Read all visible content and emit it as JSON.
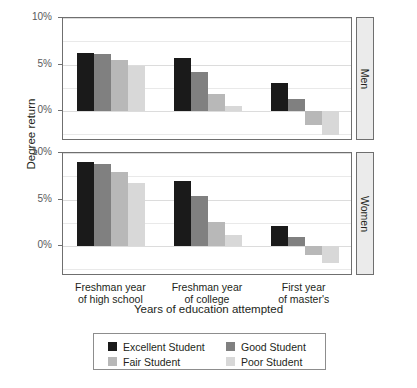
{
  "chart_data": {
    "type": "bar",
    "title": "",
    "xlabel": "Years of education attempted",
    "ylabel": "Degree return",
    "categories": [
      "Freshman year\nof high school",
      "Freshman year\nof college",
      "First year\nof master's"
    ],
    "category_lines": [
      [
        "Freshman year",
        "of high school"
      ],
      [
        "Freshman year",
        "of college"
      ],
      [
        "First year",
        "of master's"
      ]
    ],
    "ylim": [
      -3.2,
      10
    ],
    "ytick_values": [
      10,
      5,
      0
    ],
    "ytick_labels": [
      "10%",
      "5%",
      "0%"
    ],
    "gridlines": [
      10,
      7.5,
      5,
      2.5,
      0,
      -2.5
    ],
    "grid": true,
    "legend_position": "bottom",
    "facet_variable": "sex",
    "facets": [
      {
        "name": "Men",
        "series": [
          {
            "name": "Excellent Student",
            "color": "#1a1a1a",
            "values": [
              6.2,
              5.7,
              3.0
            ]
          },
          {
            "name": "Good Student",
            "color": "#808080",
            "values": [
              6.1,
              4.2,
              1.3
            ]
          },
          {
            "name": "Fair Student",
            "color": "#b8b8b8",
            "values": [
              5.5,
              1.8,
              -1.5
            ]
          },
          {
            "name": "Poor Student",
            "color": "#d8d8d8",
            "values": [
              4.9,
              0.6,
              -2.6
            ]
          }
        ]
      },
      {
        "name": "Women",
        "series": [
          {
            "name": "Excellent Student",
            "color": "#1a1a1a",
            "values": [
              9.0,
              7.0,
              2.2
            ]
          },
          {
            "name": "Good Student",
            "color": "#808080",
            "values": [
              8.8,
              5.4,
              1.0
            ]
          },
          {
            "name": "Fair Student",
            "color": "#b8b8b8",
            "values": [
              8.0,
              2.6,
              -1.0
            ]
          },
          {
            "name": "Poor Student",
            "color": "#d8d8d8",
            "values": [
              6.8,
              1.2,
              -1.8
            ]
          }
        ]
      }
    ],
    "legend": [
      {
        "label": "Excellent Student",
        "color": "#1a1a1a"
      },
      {
        "label": "Good Student",
        "color": "#808080"
      },
      {
        "label": "Fair Student",
        "color": "#b8b8b8"
      },
      {
        "label": "Poor Student",
        "color": "#d8d8d8"
      }
    ]
  }
}
